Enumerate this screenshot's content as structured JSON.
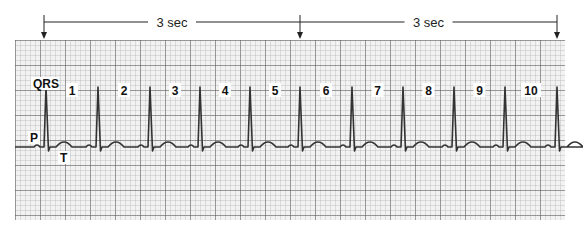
{
  "figure": {
    "type": "ECG rhythm strip",
    "interval_labels": [
      {
        "text": "3 sec",
        "from_x": 44,
        "to_x": 300
      },
      {
        "text": "3 sec",
        "from_x": 300,
        "to_x": 557
      }
    ],
    "wave_labels": {
      "qrs": "QRS",
      "p": "P",
      "t": "T"
    },
    "beat_numbers": [
      "1",
      "2",
      "3",
      "4",
      "5",
      "6",
      "7",
      "8",
      "9",
      "10"
    ],
    "qrs_x": [
      46,
      98,
      150,
      200,
      250,
      300,
      352,
      403,
      454,
      505,
      557
    ],
    "colors": {
      "grid_minor": "#9a9a9a",
      "grid_major": "#555555",
      "trace": "#333333",
      "paper": "#f2f2f2"
    }
  }
}
